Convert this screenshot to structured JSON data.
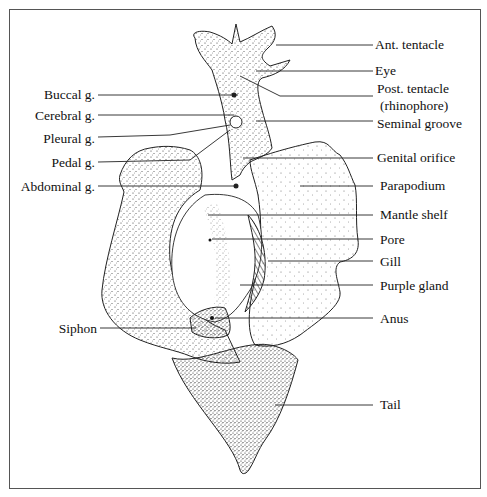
{
  "diagram": {
    "labels_left": [
      {
        "id": "buccal",
        "text": "Buccal g."
      },
      {
        "id": "cerebral",
        "text": "Cerebral g."
      },
      {
        "id": "pleural",
        "text": "Pleural g."
      },
      {
        "id": "pedal",
        "text": "Pedal g."
      },
      {
        "id": "abdominal",
        "text": "Abdominal g."
      },
      {
        "id": "siphon",
        "text": "Siphon"
      }
    ],
    "labels_right": [
      {
        "id": "ant-tentacle",
        "text": "Ant. tentacle"
      },
      {
        "id": "eye",
        "text": "Eye"
      },
      {
        "id": "post-tentacle",
        "text": "Post. tentacle"
      },
      {
        "id": "rhinophore",
        "text": "(rhinophore)"
      },
      {
        "id": "seminal-groove",
        "text": "Seminal groove"
      },
      {
        "id": "genital-orifice",
        "text": "Genital orifice"
      },
      {
        "id": "parapodium",
        "text": "Parapodium"
      },
      {
        "id": "mantle-shelf",
        "text": "Mantle shelf"
      },
      {
        "id": "pore",
        "text": "Pore"
      },
      {
        "id": "gill",
        "text": "Gill"
      },
      {
        "id": "purple-gland",
        "text": "Purple gland"
      },
      {
        "id": "anus",
        "text": "Anus"
      },
      {
        "id": "tail",
        "text": "Tail"
      }
    ]
  }
}
